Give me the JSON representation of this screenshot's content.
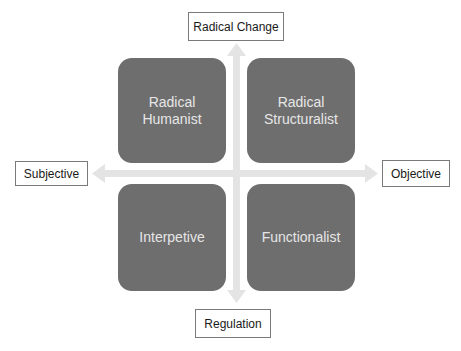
{
  "diagram": {
    "title": "",
    "axes": {
      "vertical": {
        "top_label": "Radical Change",
        "bottom_label": "Regulation"
      },
      "horizontal": {
        "left_label": "Subjective",
        "right_label": "Objective"
      }
    },
    "quadrants": [
      {
        "position": "top-left",
        "label": "Radical\nHumanist"
      },
      {
        "position": "top-right",
        "label": "Radical\nStructuralist"
      },
      {
        "position": "bottom-left",
        "label": "Interpetive"
      },
      {
        "position": "bottom-right",
        "label": "Functionalist"
      }
    ],
    "colors": {
      "quadrant_fill": "#6e6e6e",
      "quadrant_text": "#e6e6e6",
      "arrow": "#e4e4e4",
      "label_border": "#7a7a7a"
    }
  }
}
